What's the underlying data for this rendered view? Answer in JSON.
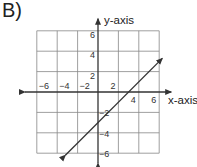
{
  "label": "B)",
  "chart_data": {
    "type": "line",
    "title": "",
    "xlabel": "x-axis",
    "ylabel": "y-axis",
    "xlim": [
      -6,
      6
    ],
    "ylim": [
      -6,
      6
    ],
    "grid": true,
    "grid_step": 2,
    "x_ticks": [
      "−6",
      "−4",
      "−2",
      "2",
      "4",
      "6"
    ],
    "y_ticks": [
      "6",
      "4",
      "2",
      "−2",
      "−4",
      "−6"
    ],
    "series": [
      {
        "name": "line",
        "equation": "y = x - 3",
        "x": [
          -3.2,
          6.3
        ],
        "y": [
          -6.2,
          3.3
        ],
        "arrows": "both"
      }
    ],
    "x_intercept": 3,
    "y_intercept": -3
  }
}
